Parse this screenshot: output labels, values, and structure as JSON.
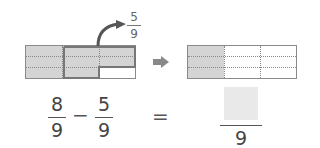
{
  "diagram": {
    "left_bar": {
      "rows": 3,
      "cols": 3,
      "shaded_parts": 8,
      "removed_parts": 5
    },
    "removed_label": {
      "numerator": "5",
      "denominator": "9"
    },
    "right_bar": {
      "rows": 3,
      "cols": 3,
      "shaded_parts": 3
    }
  },
  "equation": {
    "term1": {
      "numerator": "8",
      "denominator": "9"
    },
    "operator": "−",
    "term2": {
      "numerator": "5",
      "denominator": "9"
    },
    "equals": "=",
    "result": {
      "numerator": "",
      "denominator": "9"
    }
  },
  "colors": {
    "shade": "#d4d4d4",
    "outline": "#777777",
    "arrow": "#555555",
    "answer_box": "#e9e9e9"
  }
}
